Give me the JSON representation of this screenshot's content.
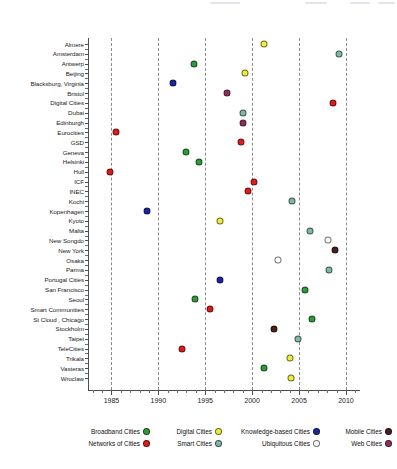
{
  "chart_data": {
    "type": "scatter",
    "title": "",
    "xlabel": "",
    "ylabel": "",
    "xlim": [
      1982.5,
      2011.5
    ],
    "xticks": [
      1985,
      1990,
      1995,
      2000,
      2005,
      2010
    ],
    "xtick_labels": [
      "1985",
      "1990",
      "1995",
      "2000",
      "2005",
      "2010"
    ],
    "grid": "vertical dashed at major x ticks",
    "legend_position": "bottom",
    "categories": [
      "Almere",
      "Amsterdam",
      "Antwerp",
      "Beijing",
      "Blacksburg, Virginia",
      "Bristol",
      "Digital Cities",
      "Dubai",
      "Edinburgh",
      "Eurocities",
      "GSD",
      "Geneva",
      "Helsinki",
      "Hull",
      "ICF",
      "INEC",
      "Kochi",
      "Kopenhagen",
      "Kyoto",
      "Malta",
      "New Songdo",
      "New York",
      "Osaka",
      "Parma",
      "Portugal Cities",
      "San Francisco",
      "Seoul",
      "Smart Communities",
      "St Cloud , Chicago",
      "Stockholm",
      "Taipei",
      "TeleCities",
      "Trikala",
      "Vasteras",
      "Wroclaw"
    ],
    "series": [
      {
        "name": "Broadband Cities",
        "color": "#2e9b3a"
      },
      {
        "name": "Networks of Cities",
        "color": "#e01b1b"
      },
      {
        "name": "Digital Cities",
        "color": "#eded3a"
      },
      {
        "name": "Smart Cities",
        "color": "#7fb8a8"
      },
      {
        "name": "Knowledge-based Cities",
        "color": "#1f23a0"
      },
      {
        "name": "Ubiquitous Cities",
        "color": "#ffffff"
      },
      {
        "name": "Mobile Cities",
        "color": "#4a1f1f"
      },
      {
        "name": "Web Cities",
        "color": "#8e3060"
      }
    ],
    "points": [
      {
        "label": "Almere",
        "year": 2001.3,
        "series": "Digital Cities"
      },
      {
        "label": "Amsterdam",
        "year": 2009.3,
        "series": "Smart Cities"
      },
      {
        "label": "Antwerp",
        "year": 1993.8,
        "series": "Broadband Cities"
      },
      {
        "label": "Beijing",
        "year": 1999.2,
        "series": "Digital Cities"
      },
      {
        "label": "Blacksburg, Virginia",
        "year": 1991.6,
        "series": "Knowledge-based Cities"
      },
      {
        "label": "Bristol",
        "year": 1997.3,
        "series": "Web Cities"
      },
      {
        "label": "Digital Cities",
        "year": 2008.6,
        "series": "Networks of Cities"
      },
      {
        "label": "Dubai",
        "year": 1999.0,
        "series": "Smart Cities"
      },
      {
        "label": "Edinburgh",
        "year": 1999.0,
        "series": "Web Cities"
      },
      {
        "label": "Eurocities",
        "year": 1985.5,
        "series": "Networks of Cities"
      },
      {
        "label": "GSD",
        "year": 1998.8,
        "series": "Networks of Cities"
      },
      {
        "label": "Geneva",
        "year": 1993.0,
        "series": "Broadband Cities"
      },
      {
        "label": "Helsinki",
        "year": 1994.3,
        "series": "Broadband Cities"
      },
      {
        "label": "Hull",
        "year": 1984.8,
        "series": "Networks of Cities"
      },
      {
        "label": "ICF",
        "year": 2000.2,
        "series": "Networks of Cities"
      },
      {
        "label": "INEC",
        "year": 1999.6,
        "series": "Networks of Cities"
      },
      {
        "label": "Kochi",
        "year": 2004.2,
        "series": "Smart Cities"
      },
      {
        "label": "Kopenhagen",
        "year": 1988.8,
        "series": "Knowledge-based Cities"
      },
      {
        "label": "Kyoto",
        "year": 1996.6,
        "series": "Digital Cities"
      },
      {
        "label": "Malta",
        "year": 2006.2,
        "series": "Smart Cities"
      },
      {
        "label": "New Songdo",
        "year": 2008.1,
        "series": "Ubiquitous Cities"
      },
      {
        "label": "New York",
        "year": 2008.8,
        "series": "Mobile Cities"
      },
      {
        "label": "Osaka",
        "year": 2002.8,
        "series": "Ubiquitous Cities"
      },
      {
        "label": "Parma",
        "year": 2008.2,
        "series": "Smart Cities"
      },
      {
        "label": "Portugal Cities",
        "year": 1996.6,
        "series": "Knowledge-based Cities"
      },
      {
        "label": "San Francisco",
        "year": 2005.6,
        "series": "Broadband Cities"
      },
      {
        "label": "Seoul",
        "year": 1993.9,
        "series": "Broadband Cities"
      },
      {
        "label": "Smart Communities",
        "year": 1995.5,
        "series": "Networks of Cities"
      },
      {
        "label": "St Cloud , Chicago",
        "year": 2006.4,
        "series": "Broadband Cities"
      },
      {
        "label": "Stockholm",
        "year": 2002.3,
        "series": "Mobile Cities"
      },
      {
        "label": "Taipei",
        "year": 2004.9,
        "series": "Smart Cities"
      },
      {
        "label": "TeleCities",
        "year": 1992.5,
        "series": "Networks of Cities"
      },
      {
        "label": "Trikala",
        "year": 2004.0,
        "series": "Digital Cities"
      },
      {
        "label": "Vasteras",
        "year": 2001.3,
        "series": "Broadband Cities"
      },
      {
        "label": "Wroclaw",
        "year": 2004.1,
        "series": "Digital Cities"
      }
    ]
  },
  "legend": {
    "columns": [
      {
        "items": [
          {
            "label": "Broadband Cities",
            "color": "#2e9b3a"
          },
          {
            "label": "Networks of Cities",
            "color": "#e01b1b"
          }
        ]
      },
      {
        "items": [
          {
            "label": "Digital Cities",
            "color": "#eded3a"
          },
          {
            "label": "Smart Cities",
            "color": "#7fb8a8"
          }
        ]
      },
      {
        "items": [
          {
            "label": "Knowledge-based Cities",
            "color": "#1f23a0"
          },
          {
            "label": "Ubiquitous Cities",
            "color": "#ffffff"
          }
        ]
      },
      {
        "items": [
          {
            "label": "Mobile Cities",
            "color": "#4a1f1f"
          },
          {
            "label": "Web Cities",
            "color": "#8e3060"
          }
        ]
      }
    ]
  }
}
